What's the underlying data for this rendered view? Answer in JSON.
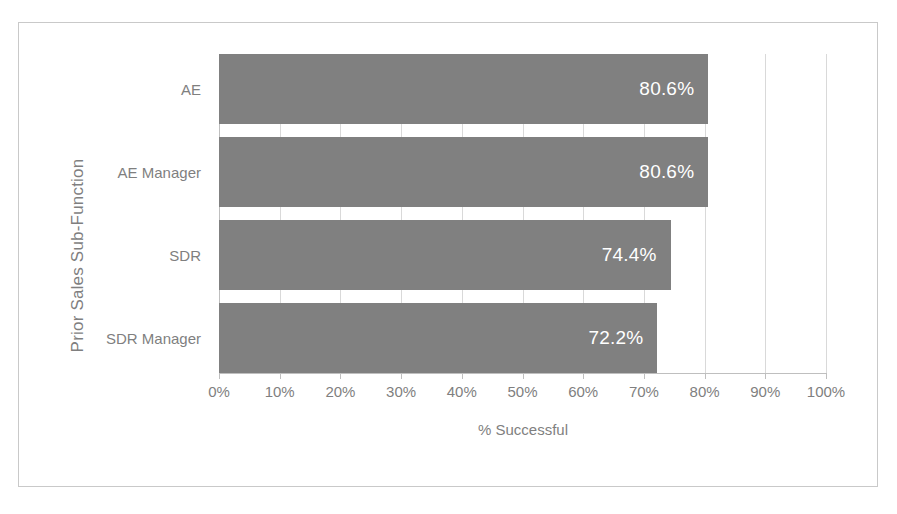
{
  "chart_data": {
    "type": "bar",
    "orientation": "horizontal",
    "title": "",
    "xlabel": "% Successful",
    "ylabel": "Prior Sales Sub-Function",
    "categories": [
      "AE",
      "AE Manager",
      "SDR",
      "SDR Manager"
    ],
    "values": [
      80.6,
      80.6,
      74.4,
      72.2
    ],
    "data_labels": [
      "80.6%",
      "80.6%",
      "74.4%",
      "72.2%"
    ],
    "xlim": [
      0,
      100
    ],
    "xticks": [
      0,
      10,
      20,
      30,
      40,
      50,
      60,
      70,
      80,
      90,
      100
    ],
    "xtick_labels": [
      "0%",
      "10%",
      "20%",
      "30%",
      "40%",
      "50%",
      "60%",
      "70%",
      "80%",
      "90%",
      "100%"
    ],
    "grid": true,
    "legend": false,
    "colors": {
      "bar": "#808080",
      "data_label": "#ffffff",
      "axis_text": "#7f7f7f",
      "gridline": "#d9d9d9",
      "axis_line": "#bfbfbf",
      "frame_border": "#c9c9c9",
      "background": "#ffffff"
    }
  }
}
